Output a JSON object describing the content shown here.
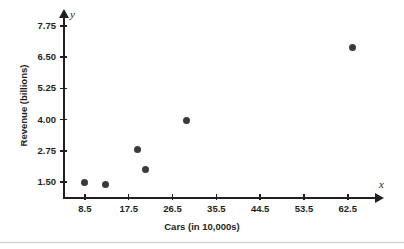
{
  "chart_data": {
    "type": "scatter",
    "title": "",
    "xlabel": "Cars (in 10,000s)",
    "ylabel": "Revenue (billions)",
    "x_var": "x",
    "y_var": "y",
    "xlim": [
      4.0,
      68.5
    ],
    "ylim": [
      0.9,
      8.15
    ],
    "xticks": [
      "8.5",
      "17.5",
      "26.5",
      "35.5",
      "44.5",
      "53.5",
      "62.5"
    ],
    "xtick_values": [
      8.5,
      17.5,
      26.5,
      35.5,
      44.5,
      53.5,
      62.5
    ],
    "yticks": [
      "1.50",
      "2.75",
      "4.00",
      "5.25",
      "6.50",
      "7.75"
    ],
    "ytick_values": [
      1.5,
      2.75,
      4.0,
      5.25,
      6.5,
      7.75
    ],
    "grid": false,
    "legend": null,
    "marker_color": "#3b3a3c",
    "axis_color": "#231f20",
    "points": [
      {
        "x": 8.5,
        "y": 1.5
      },
      {
        "x": 12.8,
        "y": 1.42
      },
      {
        "x": 19.4,
        "y": 2.8
      },
      {
        "x": 21.0,
        "y": 2.0
      },
      {
        "x": 29.3,
        "y": 3.97
      },
      {
        "x": 63.5,
        "y": 6.9
      }
    ]
  }
}
